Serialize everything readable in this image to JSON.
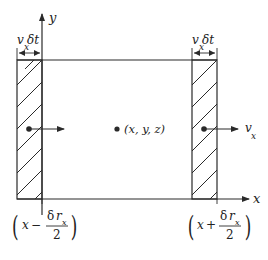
{
  "diagram": {
    "axes": {
      "y_label": "y",
      "x_label": "x"
    },
    "left_strip": {
      "width_label_v": "v",
      "width_label_sub": "x",
      "width_label_delta": "δt",
      "bottom_label": {
        "open": "(",
        "x": "x",
        "op": "−",
        "num_delta": "δ",
        "num_r": "r",
        "num_sub": "x",
        "den": "2",
        "close": ")"
      }
    },
    "right_strip": {
      "width_label_v": "v",
      "width_label_sub": "x",
      "width_label_delta": "δt",
      "flow_label_v": "v",
      "flow_label_sub": "x",
      "bottom_label": {
        "open": "(",
        "x": "x",
        "op": "+",
        "num_delta": "δ",
        "num_r": "r",
        "num_sub": "x",
        "den": "2",
        "close": ")"
      }
    },
    "center_point": {
      "label": "(x, y, z)"
    },
    "colors": {
      "stroke": "#2a2a2a",
      "background": "#ffffff"
    }
  }
}
